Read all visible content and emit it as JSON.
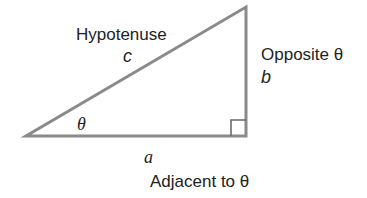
{
  "diagram": {
    "type": "right-triangle",
    "stroke_color": "#8a8a8a",
    "text_color": "#222222",
    "vertices": {
      "angle_vertex": [
        26,
        136
      ],
      "right_angle_vertex": [
        246,
        136
      ],
      "top_vertex": [
        246,
        7
      ]
    },
    "hypotenuse": {
      "label": "Hypotenuse",
      "variable": "c"
    },
    "opposite": {
      "label": "Opposite θ",
      "variable": "b"
    },
    "adjacent": {
      "label": "Adjacent to θ",
      "variable": "a"
    },
    "angle": {
      "symbol": "θ"
    },
    "right_angle_marker": true
  }
}
